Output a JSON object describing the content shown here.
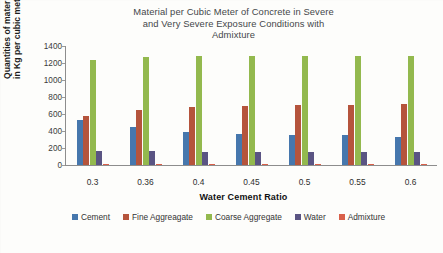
{
  "chart_data": {
    "type": "bar",
    "title": "Material per Cubic Meter of Concrete in Severe and Very Severe Exposure Conditions with Admixture",
    "title_lines": [
      "Material per Cubic Meter of Concrete in Severe",
      "and Very Severe Exposure Conditions with",
      "Admixture"
    ],
    "xlabel": "Water Cement Ratio",
    "ylabel": "Quantities of material in Kg per cubic meter",
    "ylabel_lines": [
      "Quantities of material",
      "in Kg per cubic meter"
    ],
    "categories": [
      "0.3",
      "0.36",
      "0.4",
      "0.45",
      "0.5",
      "0.55",
      "0.6"
    ],
    "ylim": [
      0,
      1400
    ],
    "yticks": [
      0,
      200,
      400,
      600,
      800,
      1000,
      1200,
      1400
    ],
    "grid": false,
    "legend_position": "bottom",
    "series": [
      {
        "name": "Cement",
        "color": "#4677ad",
        "values": [
          530,
          440,
          390,
          360,
          355,
          345,
          330
        ]
      },
      {
        "name": "Fine Aggreagate",
        "color": "#b5543c",
        "values": [
          575,
          645,
          680,
          695,
          700,
          705,
          710
        ]
      },
      {
        "name": "Coarse Aggregate",
        "color": "#93b94e",
        "values": [
          1230,
          1270,
          1275,
          1280,
          1280,
          1280,
          1280
        ]
      },
      {
        "name": "Water",
        "color": "#5a5483",
        "values": [
          160,
          158,
          156,
          155,
          154,
          153,
          152
        ]
      },
      {
        "name": "Admixture",
        "color": "#d9604a",
        "values": [
          10,
          9,
          8,
          8,
          7,
          7,
          6
        ]
      }
    ]
  }
}
